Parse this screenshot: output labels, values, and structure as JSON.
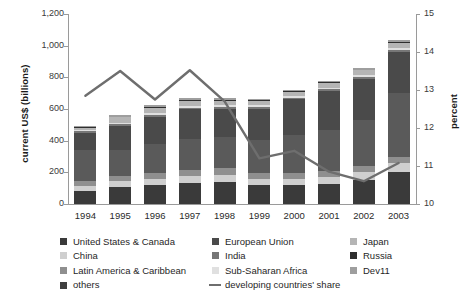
{
  "chart_data": {
    "type": "bar",
    "subtype": "stacked-bar-with-line",
    "title": "",
    "xlabel": "",
    "ylabel": "current US$ (billions)",
    "y2label": "percent",
    "ylim": [
      0,
      1200
    ],
    "y2lim": [
      10,
      15
    ],
    "ytick_step": 200,
    "y2tick_step": 1,
    "grid": false,
    "legend_position": "bottom",
    "categories": [
      "1994",
      "1995",
      "1996",
      "1997",
      "1998",
      "1999",
      "2000",
      "2001",
      "2002",
      "2003"
    ],
    "ytick_labels": [
      "0",
      "200",
      "400",
      "600",
      "800",
      "1,000",
      "1,200"
    ],
    "y2tick_labels": [
      "10",
      "11",
      "12",
      "13",
      "14",
      "15"
    ],
    "series": [
      {
        "name": "United States & Canada",
        "color": "#3a3a3a",
        "values": [
          80,
          105,
          118,
          133,
          140,
          120,
          118,
          125,
          152,
          205
        ]
      },
      {
        "name": "China",
        "color": "#cfcfcf",
        "values": [
          34,
          38,
          42,
          45,
          46,
          40,
          41,
          47,
          53,
          54
        ]
      },
      {
        "name": "Latin America & Caribbean",
        "color": "#8f8f8f",
        "values": [
          30,
          33,
          36,
          40,
          42,
          38,
          37,
          34,
          33,
          36
        ]
      },
      {
        "name": "others",
        "color": "#5a5a5a",
        "values": [
          197,
          168,
          185,
          195,
          196,
          205,
          240,
          262,
          290,
          404
        ]
      },
      {
        "name": "European Union",
        "color": "#4a4a4a",
        "values": [
          110,
          150,
          172,
          185,
          175,
          200,
          225,
          245,
          262,
          262
        ]
      },
      {
        "name": "India",
        "color": "#777777",
        "values": [
          8,
          9,
          10,
          11,
          11,
          10,
          10,
          11,
          12,
          13
        ]
      },
      {
        "name": "Sub-Saharan Africa",
        "color": "#e0e0e0",
        "values": [
          10,
          11,
          12,
          13,
          13,
          12,
          12,
          12,
          13,
          14
        ]
      },
      {
        "name": "Japan",
        "color": "#b5b5b5",
        "values": [
          12,
          34,
          35,
          32,
          30,
          27,
          27,
          28,
          29,
          30
        ]
      },
      {
        "name": "Russia",
        "color": "#2e2e2e",
        "values": [
          3,
          4,
          5,
          6,
          6,
          5,
          5,
          5,
          6,
          7
        ]
      },
      {
        "name": "Dev11",
        "color": "#9e9e9e",
        "values": [
          6,
          8,
          10,
          10,
          10,
          8,
          8,
          8,
          10,
          11
        ]
      }
    ],
    "bar_totals": [
      490,
      560,
      625,
      670,
      669,
      665,
      723,
      777,
      860,
      1036
    ],
    "line_series": {
      "name": "developing countries' share",
      "color": "#6e6e6e",
      "axis": "right",
      "values": [
        12.85,
        13.5,
        12.75,
        13.52,
        12.7,
        11.2,
        11.4,
        10.85,
        10.6,
        11.08
      ]
    }
  },
  "legend": {
    "columns": [
      [
        {
          "label": "United States & Canada",
          "swatch": "#3a3a3a",
          "type": "box"
        },
        {
          "label": "China",
          "swatch": "#cfcfcf",
          "type": "box"
        },
        {
          "label": "Latin America & Caribbean",
          "swatch": "#8f8f8f",
          "type": "box"
        },
        {
          "label": "others",
          "swatch": "#3f3f3f",
          "type": "box"
        }
      ],
      [
        {
          "label": "European Union",
          "swatch": "#4a4a4a",
          "type": "box"
        },
        {
          "label": "India",
          "swatch": "#777777",
          "type": "box"
        },
        {
          "label": "Sub-Saharan Africa",
          "swatch": "#e0e0e0",
          "type": "box"
        },
        {
          "label": "developing countries' share",
          "swatch": "#6e6e6e",
          "type": "line"
        }
      ],
      [
        {
          "label": "Japan",
          "swatch": "#b5b5b5",
          "type": "box"
        },
        {
          "label": "Russia",
          "swatch": "#2e2e2e",
          "type": "box"
        },
        {
          "label": "Dev11",
          "swatch": "#9e9e9e",
          "type": "box"
        }
      ]
    ]
  }
}
